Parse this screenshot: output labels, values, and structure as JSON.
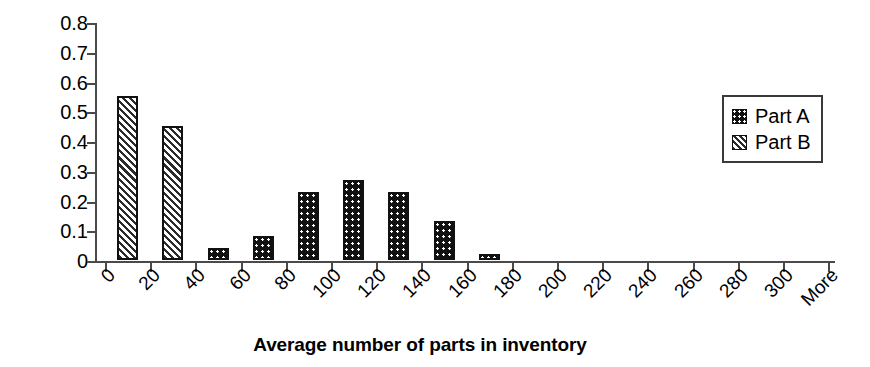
{
  "chart_data": {
    "type": "bar",
    "title": "",
    "xlabel": "Average number of parts in inventory",
    "ylabel": "Relative frequency",
    "ylim": [
      0,
      0.8
    ],
    "ytick_labels": [
      "0.8",
      "0.7",
      "0.6",
      "0.5",
      "0.4",
      "0.3",
      "0.2",
      "0.1",
      "0"
    ],
    "ytick_values": [
      0.8,
      0.7,
      0.6,
      0.5,
      0.4,
      0.3,
      0.2,
      0.1,
      0
    ],
    "categories": [
      "0",
      "20",
      "40",
      "60",
      "80",
      "100",
      "120",
      "140",
      "160",
      "180",
      "200",
      "220",
      "240",
      "260",
      "280",
      "300",
      "More"
    ],
    "grid": false,
    "legend_position": "upper right",
    "legend": [
      {
        "name": "Part A",
        "pattern": "dots"
      },
      {
        "name": "Part B",
        "pattern": "hatch"
      }
    ],
    "series": [
      {
        "name": "Part B",
        "pattern": "hatch",
        "values": [
          0.55,
          0.45,
          0,
          0,
          0,
          0,
          0,
          0,
          0,
          0,
          0,
          0,
          0,
          0,
          0,
          0,
          0
        ]
      },
      {
        "name": "Part A",
        "pattern": "dots",
        "values": [
          0,
          0,
          0.04,
          0.08,
          0.23,
          0.27,
          0.23,
          0.13,
          0.02,
          0,
          0,
          0,
          0,
          0,
          0,
          0,
          0
        ]
      }
    ],
    "bars": [
      {
        "category": "0",
        "value": 0.55,
        "series": "Part B",
        "pattern": "hatch"
      },
      {
        "category": "20",
        "value": 0.45,
        "series": "Part B",
        "pattern": "hatch"
      },
      {
        "category": "40",
        "value": 0.04,
        "series": "Part A",
        "pattern": "dots"
      },
      {
        "category": "60",
        "value": 0.08,
        "series": "Part A",
        "pattern": "dots"
      },
      {
        "category": "80",
        "value": 0.23,
        "series": "Part A",
        "pattern": "dots"
      },
      {
        "category": "100",
        "value": 0.27,
        "series": "Part A",
        "pattern": "dots"
      },
      {
        "category": "120",
        "value": 0.23,
        "series": "Part A",
        "pattern": "dots"
      },
      {
        "category": "140",
        "value": 0.13,
        "series": "Part A",
        "pattern": "dots"
      },
      {
        "category": "160",
        "value": 0.02,
        "series": "Part A",
        "pattern": "dots"
      }
    ]
  }
}
